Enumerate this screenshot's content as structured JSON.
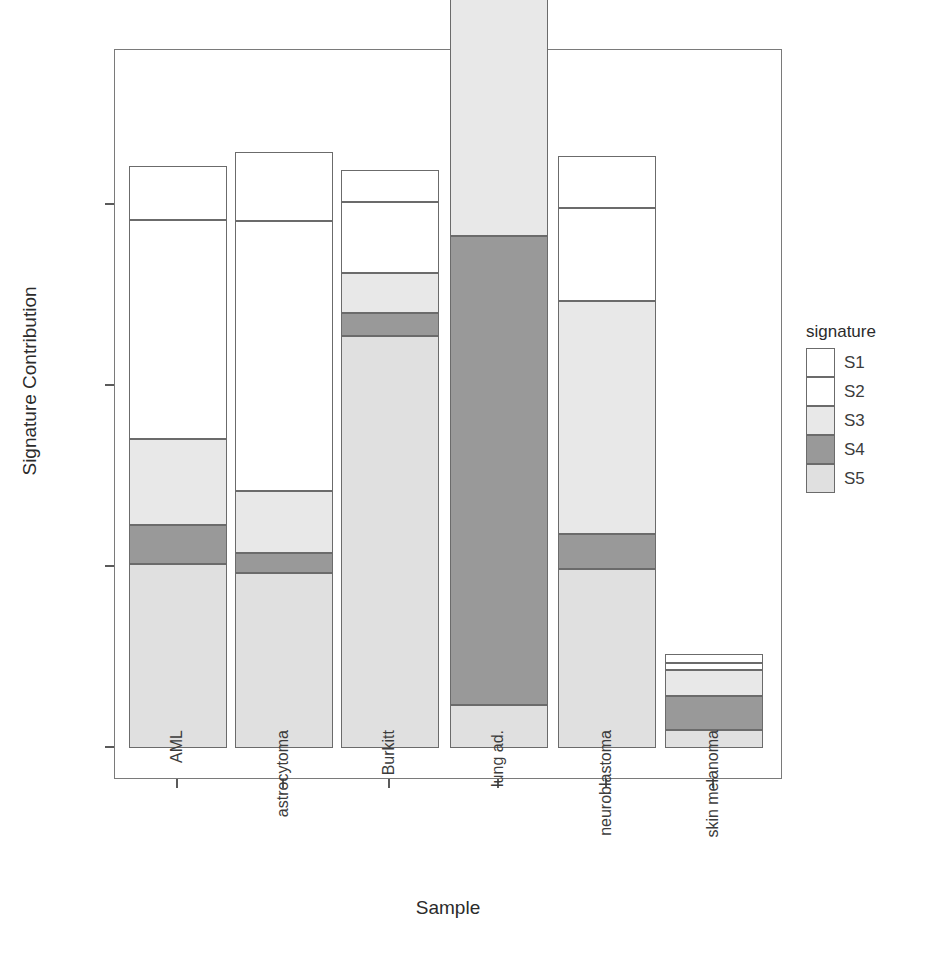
{
  "chart_data": {
    "type": "bar",
    "subtype": "stacked-bar",
    "title": "",
    "xlabel": "Sample",
    "ylabel": "Signature Contribution",
    "categories": [
      "AML",
      "astrocytoma",
      "Burkitt",
      "lung ad.",
      "neuroblastoma",
      "skin melanoma"
    ],
    "ylim": [
      0.0,
      0.0755
    ],
    "ytick_values": [
      0.0,
      0.02,
      0.04,
      0.06
    ],
    "ytick_labels": [
      "0.00",
      "0.02",
      "0.04",
      "0.06"
    ],
    "grid": false,
    "legend_title": "signature",
    "legend_position": "right",
    "series": [
      {
        "name": "S1",
        "values": [
          0.006,
          0.0076,
          0.0035,
          0.0011,
          0.00575,
          0.00095
        ]
      },
      {
        "name": "S2",
        "values": [
          0.0242,
          0.02985,
          0.00785,
          0.00565,
          0.01025,
          0.00075
        ]
      },
      {
        "name": "S3",
        "values": [
          0.0095,
          0.00685,
          0.0044,
          0.03125,
          0.02575,
          0.0029
        ]
      },
      {
        "name": "S4",
        "values": [
          0.0043,
          0.0022,
          0.00255,
          0.0518,
          0.00385,
          0.00375
        ]
      },
      {
        "name": "S5",
        "values": [
          0.0203,
          0.01935,
          0.04555,
          0.00475,
          0.0198,
          0.002
        ]
      }
    ],
    "totals": [
      0.0643,
      0.0639,
      0.0639,
      0.0746,
      0.0654,
      0.064
    ],
    "colors": {
      "S1": "#ffffff",
      "S2": "#ffffff",
      "S3": "#e8e8e8",
      "S4": "#999999",
      "S5": "#e0e0e0",
      "border": "#6b6b6b",
      "panel_border": "#7a7a7a",
      "axis": "#5a5a5a",
      "text": "#3c3c3c",
      "background": "#ffffff"
    }
  }
}
